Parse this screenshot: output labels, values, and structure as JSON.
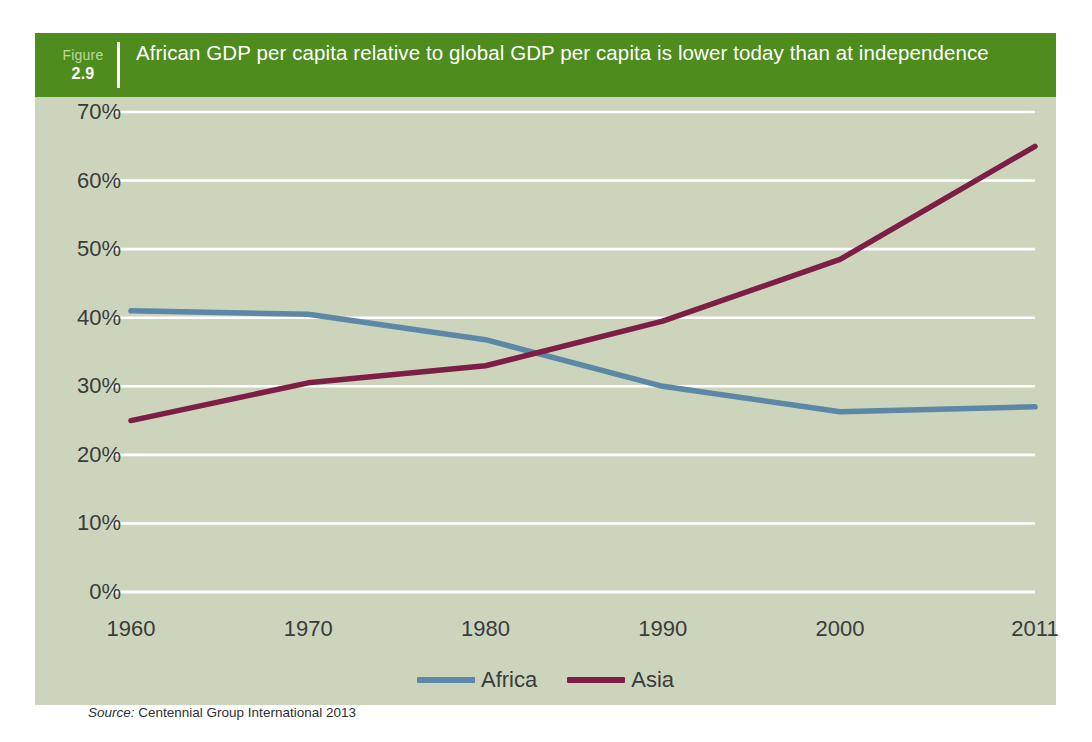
{
  "figure": {
    "label_word": "Figure",
    "number": "2.9",
    "title": "African GDP per capita relative to global GDP per capita is lower today than at independence",
    "source_label": "Source:",
    "source_text": "Centennial Group International 2013"
  },
  "colors": {
    "panel_background": "#ccd5bc",
    "header_green": "#4e8c1e",
    "header_number_color": "#bcd9a0",
    "gridline": "#ffffff",
    "africa": "#5d87a6",
    "asia": "#7d1f45",
    "text": "#3b3b3b"
  },
  "chart_data": {
    "type": "line",
    "title": "African GDP per capita relative to global GDP per capita is lower today than at independence",
    "xlabel": "",
    "ylabel": "",
    "categories": [
      "1960",
      "1970",
      "1980",
      "1990",
      "2000",
      "2011"
    ],
    "x": [
      1960,
      1970,
      1980,
      1990,
      2000,
      2011
    ],
    "xlim": [
      1960,
      2011
    ],
    "ylim": [
      0,
      70
    ],
    "ytick_labels": [
      "0%",
      "10%",
      "20%",
      "30%",
      "40%",
      "50%",
      "60%",
      "70%"
    ],
    "yticks": [
      0,
      10,
      20,
      30,
      40,
      50,
      60,
      70
    ],
    "grid": "horizontal",
    "legend_position": "bottom-center",
    "series": [
      {
        "name": "Africa",
        "color": "#5d87a6",
        "values": [
          41,
          40.5,
          36.8,
          30,
          26.3,
          27
        ]
      },
      {
        "name": "Asia",
        "color": "#7d1f45",
        "values": [
          25,
          30.5,
          33,
          39.5,
          48.5,
          65
        ]
      }
    ],
    "source": "Source: Centennial Group International 2013"
  }
}
